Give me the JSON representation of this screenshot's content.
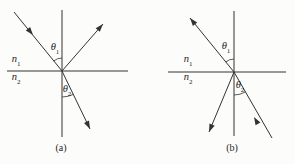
{
  "figure": {
    "colors": {
      "background": "#fcfcfa",
      "line": "#333333",
      "text": "#1f1f1f"
    }
  },
  "panel_a": {
    "caption": "(a)",
    "labels": {
      "theta1": {
        "base": "θ",
        "sub": "1"
      },
      "theta2": {
        "base": "θ",
        "sub": "2"
      },
      "n1": {
        "base": "n",
        "sub": "1"
      },
      "n2": {
        "base": "n",
        "sub": "2"
      }
    }
  },
  "panel_b": {
    "caption": "(b)",
    "labels": {
      "theta1": {
        "base": "θ",
        "sub": "1"
      },
      "theta2": {
        "base": "θ",
        "sub": "2"
      },
      "n1": {
        "base": "n",
        "sub": "1"
      },
      "n2": {
        "base": "n",
        "sub": "2"
      }
    }
  }
}
